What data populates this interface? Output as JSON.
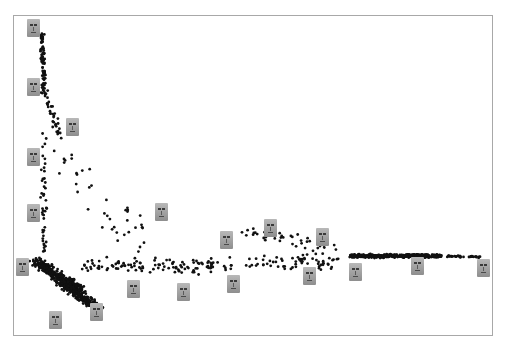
{
  "chart_data": {
    "type": "scatter",
    "title": "",
    "xlabel": "",
    "ylabel": "",
    "grid": false,
    "legend": null,
    "frame": {
      "left": 13,
      "top": 15,
      "right": 493,
      "bottom": 336
    },
    "point_color": "#111111",
    "point_radius": 1.4,
    "clusters": [
      {
        "name": "top-stream",
        "from": [
          42,
          35
        ],
        "to": [
          44,
          90
        ],
        "count": 80,
        "spread": 3
      },
      {
        "name": "upper-diag",
        "from": [
          44,
          90
        ],
        "to": [
          60,
          135
        ],
        "count": 40,
        "spread": 6
      },
      {
        "name": "vertical-left",
        "from": [
          44,
          135
        ],
        "to": [
          44,
          255
        ],
        "count": 45,
        "spread": 4
      },
      {
        "name": "mid-scatter",
        "from": [
          60,
          150
        ],
        "to": [
          150,
          250
        ],
        "count": 40,
        "spread": 25
      },
      {
        "name": "dense-blob",
        "from": [
          35,
          262
        ],
        "to": [
          80,
          290
        ],
        "count": 380,
        "spread": 8
      },
      {
        "name": "dense-diag",
        "from": [
          60,
          282
        ],
        "to": [
          100,
          310
        ],
        "count": 260,
        "spread": 7
      },
      {
        "name": "mid-band",
        "from": [
          80,
          268
        ],
        "to": [
          340,
          262
        ],
        "count": 180,
        "spread": 11
      },
      {
        "name": "right-dense",
        "from": [
          350,
          256
        ],
        "to": [
          440,
          256
        ],
        "count": 420,
        "spread": 2.5
      },
      {
        "name": "right-tail",
        "from": [
          440,
          256
        ],
        "to": [
          480,
          257
        ],
        "count": 40,
        "spread": 1.5
      },
      {
        "name": "upper-mid",
        "from": [
          240,
          230
        ],
        "to": [
          340,
          250
        ],
        "count": 40,
        "spread": 10
      }
    ],
    "image_markers": [
      {
        "x": 33,
        "y": 28
      },
      {
        "x": 33,
        "y": 87
      },
      {
        "x": 72,
        "y": 127
      },
      {
        "x": 33,
        "y": 157
      },
      {
        "x": 33,
        "y": 213
      },
      {
        "x": 161,
        "y": 212
      },
      {
        "x": 22,
        "y": 267
      },
      {
        "x": 226,
        "y": 240
      },
      {
        "x": 270,
        "y": 228
      },
      {
        "x": 322,
        "y": 237
      },
      {
        "x": 133,
        "y": 289
      },
      {
        "x": 183,
        "y": 292
      },
      {
        "x": 233,
        "y": 284
      },
      {
        "x": 309,
        "y": 276
      },
      {
        "x": 355,
        "y": 272
      },
      {
        "x": 417,
        "y": 266
      },
      {
        "x": 483,
        "y": 268
      },
      {
        "x": 55,
        "y": 320
      },
      {
        "x": 96,
        "y": 312
      }
    ]
  }
}
